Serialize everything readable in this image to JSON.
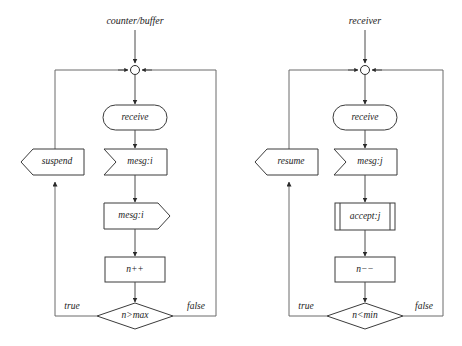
{
  "diagram": {
    "type": "flowchart",
    "title": "",
    "background_color": "#ffffff",
    "shape_fill": "#ffffff",
    "shape_stroke": "#3b3b3b",
    "connector_color": "#6a6a6a",
    "text_color": "#1c1c1c",
    "lanes": [
      {
        "id": "counter-buffer",
        "title": "counter/buffer",
        "nodes": [
          {
            "id": "merge",
            "shape": "junction-circle",
            "label": ""
          },
          {
            "id": "receive",
            "shape": "stadium",
            "label": "receive"
          },
          {
            "id": "recv-msg",
            "shape": "receive-signal",
            "label": "mesg:i"
          },
          {
            "id": "send-msg",
            "shape": "send-signal",
            "label": "mesg:i"
          },
          {
            "id": "increment",
            "shape": "rectangle",
            "label": "n++"
          },
          {
            "id": "decision",
            "shape": "diamond",
            "label": "n>max"
          },
          {
            "id": "suspend",
            "shape": "send-signal-left",
            "label": "suspend"
          }
        ],
        "edge_labels": {
          "true": "true",
          "false": "false"
        }
      },
      {
        "id": "receiver",
        "title": "receiver",
        "nodes": [
          {
            "id": "merge",
            "shape": "junction-circle",
            "label": ""
          },
          {
            "id": "receive",
            "shape": "stadium",
            "label": "receive"
          },
          {
            "id": "recv-msg",
            "shape": "receive-signal",
            "label": "mesg:j"
          },
          {
            "id": "accept",
            "shape": "predefined-process",
            "label": "accept:j"
          },
          {
            "id": "decrement",
            "shape": "rectangle",
            "label": "n−−"
          },
          {
            "id": "decision",
            "shape": "diamond",
            "label": "n<min"
          },
          {
            "id": "resume",
            "shape": "send-signal-left",
            "label": "resume"
          }
        ],
        "edge_labels": {
          "true": "true",
          "false": "false"
        }
      }
    ]
  }
}
